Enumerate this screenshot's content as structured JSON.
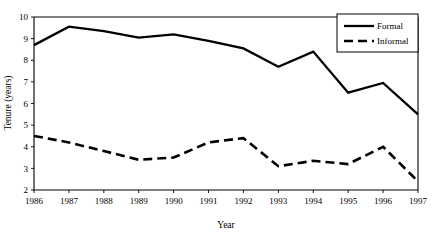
{
  "chart_data": {
    "type": "line",
    "title": "",
    "xlabel": "Year",
    "ylabel": "Tenure (years)",
    "categories": [
      "1986",
      "1987",
      "1988",
      "1989",
      "1990",
      "1991",
      "1992",
      "1993",
      "1994",
      "1995",
      "1996",
      "1997"
    ],
    "x": [
      1986,
      1987,
      1988,
      1989,
      1990,
      1991,
      1992,
      1993,
      1994,
      1995,
      1996,
      1997
    ],
    "xlim": [
      1986,
      1997
    ],
    "ylim": [
      2,
      10
    ],
    "yticks": [
      2,
      3,
      4,
      5,
      6,
      7,
      8,
      9,
      10
    ],
    "ytick_labels": [
      "2",
      "3",
      "4",
      "5",
      "6",
      "7",
      "8",
      "9",
      "10"
    ],
    "xticks": [
      1986,
      1987,
      1988,
      1989,
      1990,
      1991,
      1992,
      1993,
      1994,
      1995,
      1996,
      1997
    ],
    "xtick_labels": [
      "1986",
      "1987",
      "1988",
      "1989",
      "1990",
      "1991",
      "1992",
      "1993",
      "1994",
      "1995",
      "1996",
      "1997"
    ],
    "grid": false,
    "legend_position": "top-right",
    "series": [
      {
        "name": "Formal",
        "style": "solid",
        "color": "#000000",
        "values": [
          8.7,
          9.55,
          9.35,
          9.05,
          9.2,
          8.9,
          8.55,
          7.7,
          8.4,
          6.5,
          6.95,
          5.5
        ]
      },
      {
        "name": "Informal",
        "style": "dashed",
        "color": "#000000",
        "values": [
          4.5,
          4.2,
          3.8,
          3.4,
          3.5,
          4.2,
          4.4,
          3.1,
          3.35,
          3.2,
          4.0,
          2.4
        ]
      }
    ]
  },
  "axes": {
    "y_title": "Tenure (years)",
    "x_title": "Year"
  },
  "legend": {
    "items": [
      {
        "label": "Formal"
      },
      {
        "label": "Informal"
      }
    ]
  }
}
